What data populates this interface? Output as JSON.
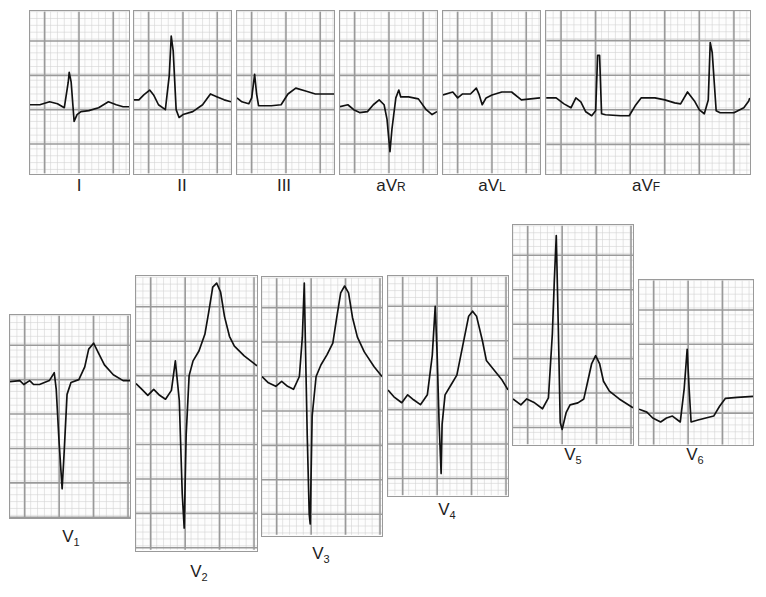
{
  "figure": {
    "colors": {
      "grid_major": "#9a9a9a",
      "grid_minor": "#d2d2d2",
      "trace": "#111111",
      "label": "#222222"
    }
  },
  "limb_leads": [
    {
      "id": "I",
      "label": "I",
      "main": "I",
      "sub": ""
    },
    {
      "id": "II",
      "label": "II",
      "main": "II",
      "sub": ""
    },
    {
      "id": "III",
      "label": "III",
      "main": "III",
      "sub": ""
    },
    {
      "id": "aVR",
      "label": "aVR",
      "main": "aV",
      "sub": "R"
    },
    {
      "id": "aVL",
      "label": "aVL",
      "main": "aV",
      "sub": "L"
    },
    {
      "id": "aVF",
      "label": "aVF",
      "main": "aV",
      "sub": "F"
    }
  ],
  "precordial_leads": [
    {
      "id": "V1",
      "label": "V1",
      "main": "V",
      "sub": "1"
    },
    {
      "id": "V2",
      "label": "V2",
      "main": "V",
      "sub": "2"
    },
    {
      "id": "V3",
      "label": "V3",
      "main": "V",
      "sub": "3"
    },
    {
      "id": "V4",
      "label": "V4",
      "main": "V",
      "sub": "4"
    },
    {
      "id": "V5",
      "label": "V5",
      "main": "V",
      "sub": "5"
    },
    {
      "id": "V6",
      "label": "V6",
      "main": "V",
      "sub": "6"
    }
  ]
}
